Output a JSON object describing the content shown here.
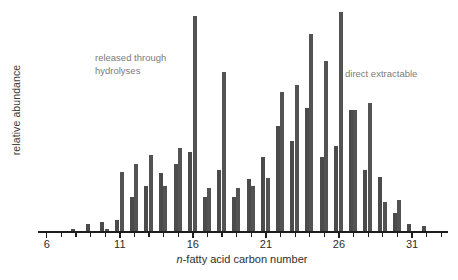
{
  "axes": {
    "ylabel": "relative abundance",
    "xlabel_prefix": "n",
    "xlabel_rest": "-fatty acid carbon number",
    "xlabel_full": "n-fatty acid carbon number",
    "tick_labels": [
      "6",
      "11",
      "16",
      "21",
      "26",
      "31"
    ],
    "tick_label_values": [
      6,
      11,
      16,
      21,
      26,
      31
    ],
    "tick_min": 6,
    "tick_max": 33,
    "tick_step": 1
  },
  "annotations": [
    {
      "name": "released-through-hydrolyses",
      "text": "released through\nhydrolyses",
      "color": "#7b7b7b"
    },
    {
      "name": "direct-extractable",
      "text": "direct extractable",
      "color": "#7b7b7b"
    }
  ],
  "colors": {
    "bar_series_a": "#4b4b4b",
    "bar_series_b": "#535353",
    "axis": "#1d1d1d",
    "annotation_text": "#7b7b7b",
    "label_text": "#2e2e2e",
    "background": "#ffffff"
  },
  "chart_data": {
    "type": "bar",
    "title": "",
    "xlabel": "n-fatty acid carbon number",
    "ylabel": "relative abundance",
    "grid": false,
    "legend_position": "none",
    "xlim": [
      5.4,
      33.6
    ],
    "ylim": [
      0,
      100
    ],
    "categories": [
      6,
      7,
      8,
      9,
      10,
      11,
      12,
      13,
      14,
      15,
      16,
      17,
      18,
      19,
      20,
      21,
      22,
      23,
      24,
      25,
      26,
      27,
      28,
      29,
      30,
      31,
      32,
      33
    ],
    "series": [
      {
        "name": "released through hydrolyses",
        "values": [
          0,
          0,
          1.5,
          3.5,
          4.5,
          5.5,
          15.5,
          20.5,
          26.5,
          30.5,
          35.5,
          15.5,
          27.5,
          15.5,
          23.5,
          33.5,
          47.5,
          40.5,
          55.5,
          33.5,
          38.5,
          54.5,
          27.5,
          24.5,
          8.5,
          3.5,
          2.5,
          0
        ]
      },
      {
        "name": "direct extractable",
        "values": [
          0,
          0,
          0,
          0,
          1.5,
          27.0,
          30.5,
          34.5,
          20.5,
          37.5,
          96.5,
          19.5,
          71.5,
          19.5,
          20.5,
          24.0,
          62.5,
          65.5,
          88.5,
          76.5,
          98.0,
          54.5,
          57.5,
          13.5,
          14.5,
          0,
          0,
          0
        ]
      }
    ]
  }
}
